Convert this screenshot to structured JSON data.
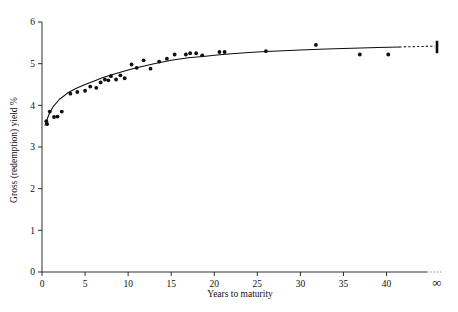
{
  "figure": {
    "background": "#ffffff",
    "ink_color": "#0d0d0d"
  },
  "chart_data": {
    "type": "scatter",
    "title": "",
    "xlabel": "Years to maturity",
    "ylabel": "Gross (redemption) yield %",
    "xlim": [
      0,
      44
    ],
    "ylim": [
      0,
      6
    ],
    "xticks": [
      0,
      5,
      10,
      15,
      20,
      25,
      30,
      35,
      40
    ],
    "xticklabels": [
      "0",
      "5",
      "10",
      "15",
      "20",
      "25",
      "30",
      "35",
      "40"
    ],
    "yticks": [
      0,
      1,
      2,
      3,
      4,
      5,
      6
    ],
    "yticklabels": [
      "0",
      "1",
      "2",
      "3",
      "4",
      "5",
      "6"
    ],
    "x_axis_break_label": "∞",
    "x_axis_break_note": "axis broken with dashes before infinity (undated stocks)",
    "grid": false,
    "legend": null,
    "series": [
      {
        "name": "Observed gross redemption yields",
        "marker": "filled-circle",
        "color": "#0d0d0d",
        "points": [
          {
            "x": 0.5,
            "y": 3.62
          },
          {
            "x": 0.6,
            "y": 3.55
          },
          {
            "x": 0.9,
            "y": 3.85
          },
          {
            "x": 1.4,
            "y": 3.72
          },
          {
            "x": 1.8,
            "y": 3.73
          },
          {
            "x": 2.3,
            "y": 3.85
          },
          {
            "x": 3.3,
            "y": 4.28
          },
          {
            "x": 4.1,
            "y": 4.32
          },
          {
            "x": 5.0,
            "y": 4.35
          },
          {
            "x": 5.6,
            "y": 4.45
          },
          {
            "x": 6.3,
            "y": 4.42
          },
          {
            "x": 6.8,
            "y": 4.55
          },
          {
            "x": 7.3,
            "y": 4.62
          },
          {
            "x": 7.7,
            "y": 4.6
          },
          {
            "x": 8.0,
            "y": 4.7
          },
          {
            "x": 8.6,
            "y": 4.62
          },
          {
            "x": 9.1,
            "y": 4.72
          },
          {
            "x": 9.6,
            "y": 4.65
          },
          {
            "x": 10.4,
            "y": 4.98
          },
          {
            "x": 11.0,
            "y": 4.9
          },
          {
            "x": 11.8,
            "y": 5.08
          },
          {
            "x": 12.6,
            "y": 4.88
          },
          {
            "x": 13.6,
            "y": 5.05
          },
          {
            "x": 14.5,
            "y": 5.12
          },
          {
            "x": 15.4,
            "y": 5.22
          },
          {
            "x": 16.7,
            "y": 5.22
          },
          {
            "x": 17.2,
            "y": 5.25
          },
          {
            "x": 17.9,
            "y": 5.25
          },
          {
            "x": 18.6,
            "y": 5.2
          },
          {
            "x": 20.6,
            "y": 5.28
          },
          {
            "x": 21.2,
            "y": 5.28
          },
          {
            "x": 26.0,
            "y": 5.3
          },
          {
            "x": 31.8,
            "y": 5.45
          },
          {
            "x": 36.9,
            "y": 5.22
          },
          {
            "x": 40.2,
            "y": 5.22
          }
        ]
      }
    ],
    "fitted_curve": {
      "name": "Fitted yield curve",
      "style": "solid-with-dashed-extension",
      "color": "#0d0d0d",
      "points": [
        {
          "x": 0.35,
          "y": 3.52
        },
        {
          "x": 0.8,
          "y": 3.78
        },
        {
          "x": 1.3,
          "y": 3.97
        },
        {
          "x": 2.0,
          "y": 4.14
        },
        {
          "x": 3.0,
          "y": 4.3
        },
        {
          "x": 4.0,
          "y": 4.41
        },
        {
          "x": 5.0,
          "y": 4.5
        },
        {
          "x": 6.0,
          "y": 4.58
        },
        {
          "x": 7.0,
          "y": 4.66
        },
        {
          "x": 8.0,
          "y": 4.73
        },
        {
          "x": 9.0,
          "y": 4.79
        },
        {
          "x": 10.0,
          "y": 4.85
        },
        {
          "x": 11.0,
          "y": 4.9
        },
        {
          "x": 12.0,
          "y": 4.95
        },
        {
          "x": 13.0,
          "y": 5.0
        },
        {
          "x": 14.0,
          "y": 5.04
        },
        {
          "x": 15.0,
          "y": 5.08
        },
        {
          "x": 16.0,
          "y": 5.11
        },
        {
          "x": 17.0,
          "y": 5.14
        },
        {
          "x": 18.0,
          "y": 5.16
        },
        {
          "x": 19.0,
          "y": 5.18
        },
        {
          "x": 20.0,
          "y": 5.2
        },
        {
          "x": 22.0,
          "y": 5.24
        },
        {
          "x": 24.0,
          "y": 5.27
        },
        {
          "x": 26.0,
          "y": 5.29
        },
        {
          "x": 28.0,
          "y": 5.31
        },
        {
          "x": 30.0,
          "y": 5.33
        },
        {
          "x": 33.0,
          "y": 5.35
        },
        {
          "x": 36.0,
          "y": 5.37
        },
        {
          "x": 39.0,
          "y": 5.39
        },
        {
          "x": 41.5,
          "y": 5.4
        }
      ],
      "dashed_from_x": 41.5,
      "dashed_to_x": 43.6,
      "terminal_marker": {
        "x": 43.7,
        "y_low": 5.25,
        "y_high": 5.55
      }
    }
  }
}
